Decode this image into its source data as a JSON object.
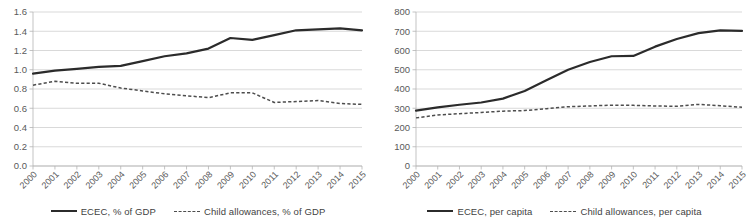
{
  "figure": {
    "background": "#ffffff",
    "panel_count": 2
  },
  "colors": {
    "solid_series": "#2b2b2b",
    "dashed_series": "#4d4d4d",
    "gridline": "#c8c8c8",
    "axis": "#b4b4b4",
    "tick_text": "#5a5a5a"
  },
  "chart_data": [
    {
      "type": "line",
      "panel": "left",
      "title": "",
      "xlabel": "",
      "ylabel": "",
      "grid": true,
      "legend_position": "bottom",
      "x": [
        "2000",
        "2001",
        "2002",
        "2003",
        "2004",
        "2005",
        "2006",
        "2007",
        "2008",
        "2009",
        "2010",
        "2011",
        "2012",
        "2013",
        "2014",
        "2015"
      ],
      "categories": [
        "2000",
        "2001",
        "2002",
        "2003",
        "2004",
        "2005",
        "2006",
        "2007",
        "2008",
        "2009",
        "2010",
        "2011",
        "2012",
        "2013",
        "2014",
        "2015"
      ],
      "ylim": [
        0.0,
        1.6
      ],
      "yticks": [
        "0.0",
        "0.2",
        "0.4",
        "0.6",
        "0.8",
        "1.0",
        "1.2",
        "1.4",
        "1.6"
      ],
      "ytick_values": [
        0.0,
        0.2,
        0.4,
        0.6,
        0.8,
        1.0,
        1.2,
        1.4,
        1.6
      ],
      "series": [
        {
          "name": "ECEC, % of GDP",
          "style": "solid",
          "values": [
            0.96,
            0.99,
            1.01,
            1.03,
            1.04,
            1.09,
            1.14,
            1.17,
            1.22,
            1.33,
            1.31,
            1.36,
            1.41,
            1.42,
            1.43,
            1.41
          ]
        },
        {
          "name": "Child allowances, % of GDP",
          "style": "dashed",
          "values": [
            0.84,
            0.88,
            0.86,
            0.86,
            0.81,
            0.78,
            0.75,
            0.73,
            0.71,
            0.76,
            0.76,
            0.66,
            0.67,
            0.68,
            0.65,
            0.64
          ]
        }
      ],
      "legend": [
        {
          "label": "ECEC, % of GDP",
          "style": "solid"
        },
        {
          "label": "Child allowances, % of GDP",
          "style": "dashed"
        }
      ]
    },
    {
      "type": "line",
      "panel": "right",
      "title": "",
      "xlabel": "",
      "ylabel": "",
      "grid": true,
      "legend_position": "bottom",
      "x": [
        "2000",
        "2001",
        "2002",
        "2003",
        "2004",
        "2005",
        "2006",
        "2007",
        "2008",
        "2009",
        "2010",
        "2011",
        "2012",
        "2013",
        "2014",
        "2015"
      ],
      "categories": [
        "2000",
        "2001",
        "2002",
        "2003",
        "2004",
        "2005",
        "2006",
        "2007",
        "2008",
        "2009",
        "2010",
        "2011",
        "2012",
        "2013",
        "2014",
        "2015"
      ],
      "ylim": [
        0,
        800
      ],
      "yticks": [
        "0",
        "100",
        "200",
        "300",
        "400",
        "500",
        "600",
        "700",
        "800"
      ],
      "ytick_values": [
        0,
        100,
        200,
        300,
        400,
        500,
        600,
        700,
        800
      ],
      "series": [
        {
          "name": "ECEC, per capita",
          "style": "solid",
          "values": [
            288,
            305,
            318,
            330,
            350,
            390,
            445,
            500,
            540,
            570,
            572,
            620,
            660,
            690,
            705,
            702
          ]
        },
        {
          "name": "Child allowances, per capita",
          "style": "dashed",
          "values": [
            250,
            265,
            272,
            278,
            285,
            288,
            298,
            308,
            312,
            316,
            315,
            312,
            310,
            320,
            313,
            305
          ]
        }
      ],
      "legend": [
        {
          "label": "ECEC, per capita",
          "style": "solid"
        },
        {
          "label": "Child allowances, per capita",
          "style": "dashed"
        }
      ]
    }
  ]
}
